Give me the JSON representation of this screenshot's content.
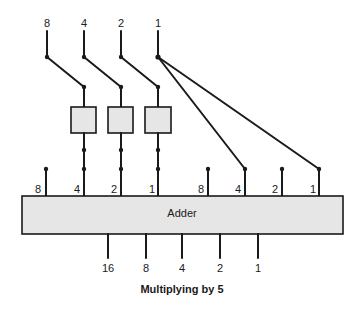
{
  "diagram": {
    "title": "Multiplying by 5",
    "adder": {
      "label": "Adder",
      "x": 22,
      "y": 196,
      "width": 321,
      "height": 38,
      "fill": "#e6e6e6"
    },
    "inputs": [
      {
        "label": "8",
        "x": 47
      },
      {
        "label": "4",
        "x": 84
      },
      {
        "label": "2",
        "x": 121
      },
      {
        "label": "1",
        "x": 158
      }
    ],
    "shift_boxes": [
      {
        "x": 71,
        "y": 107,
        "width": 25,
        "height": 26
      },
      {
        "x": 108,
        "y": 107,
        "width": 25,
        "height": 26
      },
      {
        "x": 145,
        "y": 107,
        "width": 26,
        "height": 26
      }
    ],
    "adder_inputs_left": [
      {
        "label": "8",
        "x": 46
      },
      {
        "label": "4",
        "x": 84
      },
      {
        "label": "2",
        "x": 121
      },
      {
        "label": "1",
        "x": 158
      }
    ],
    "adder_inputs_right": [
      {
        "label": "8",
        "x": 208
      },
      {
        "label": "4",
        "x": 245
      },
      {
        "label": "2",
        "x": 282
      },
      {
        "label": "1",
        "x": 319
      }
    ],
    "outputs": [
      {
        "label": "16",
        "x": 108
      },
      {
        "label": "8",
        "x": 146
      },
      {
        "label": "4",
        "x": 182
      },
      {
        "label": "2",
        "x": 220
      },
      {
        "label": "1",
        "x": 258
      }
    ]
  }
}
